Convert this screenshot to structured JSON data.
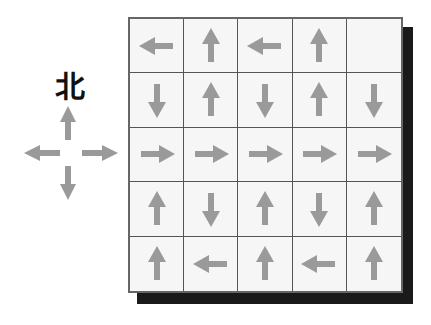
{
  "compass": {
    "north_label": "北",
    "directions": [
      "up",
      "right",
      "down",
      "left"
    ]
  },
  "colors": {
    "arrow": "#9a9a9a",
    "grid_line": "#555555",
    "cell_bg": "#f6f6f6",
    "shadow": "#1a1a1a"
  },
  "grid": {
    "rows": 5,
    "cols": 5,
    "cells": [
      [
        "left",
        "up",
        "left",
        "up",
        "empty"
      ],
      [
        "down",
        "up",
        "down",
        "up",
        "down"
      ],
      [
        "right",
        "right",
        "right",
        "right",
        "right"
      ],
      [
        "up",
        "down",
        "up",
        "down",
        "up"
      ],
      [
        "up",
        "left",
        "up",
        "left",
        "up"
      ]
    ]
  }
}
